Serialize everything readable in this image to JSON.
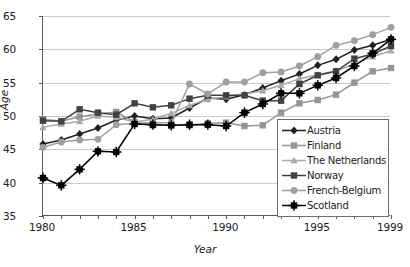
{
  "chart_data": {
    "type": "line",
    "title": "",
    "xlabel": "Year",
    "ylabel": "Age",
    "xlim": [
      1980,
      1999
    ],
    "ylim": [
      35,
      65
    ],
    "yticks": [
      35,
      40,
      45,
      50,
      55,
      60,
      65
    ],
    "xticks": [
      1980,
      1981,
      1982,
      1983,
      1984,
      1985,
      1986,
      1987,
      1988,
      1989,
      1990,
      1991,
      1992,
      1993,
      1994,
      1995,
      1996,
      1997,
      1998,
      1999
    ],
    "xtick_labels": [
      "1980",
      "1985",
      "1990",
      "1995",
      "1999"
    ],
    "xtick_label_years": [
      1980,
      1985,
      1990,
      1995,
      1999
    ],
    "grid": "horizontal",
    "legend_position": "bottom-right",
    "x": [
      1980,
      1981,
      1982,
      1983,
      1984,
      1985,
      1986,
      1987,
      1988,
      1989,
      1990,
      1991,
      1992,
      1993,
      1994,
      1995,
      1996,
      1997,
      1998,
      1999
    ],
    "series": [
      {
        "name": "Austria",
        "color": "#231f20",
        "marker": "diamond",
        "values": [
          45.8,
          46.4,
          47.3,
          48.2,
          49.4,
          50.0,
          49.6,
          49.7,
          51.2,
          52.7,
          52.5,
          53.2,
          54.2,
          55.3,
          56.3,
          57.6,
          58.5,
          59.9,
          60.6,
          61.5
        ]
      },
      {
        "name": "Finland",
        "color": "#939598",
        "marker": "square",
        "values": [
          49.5,
          49.2,
          49.9,
          50.3,
          50.6,
          49.1,
          48.6,
          48.6,
          48.6,
          48.9,
          49.0,
          48.5,
          48.6,
          50.5,
          51.9,
          52.4,
          53.2,
          55.0,
          56.7,
          57.2
        ]
      },
      {
        "name": "The Netherlands",
        "color": "#a7a9ac",
        "marker": "triangle",
        "values": [
          48.3,
          48.8,
          49.2,
          50.0,
          49.8,
          49.1,
          49.5,
          50.4,
          51.6,
          52.5,
          52.9,
          53.3,
          53.8,
          54.6,
          55.6,
          56.2,
          56.8,
          57.8,
          58.9,
          59.8
        ]
      },
      {
        "name": "Norway",
        "color": "#414042",
        "marker": "square",
        "values": [
          49.3,
          49.2,
          51.0,
          50.5,
          50.2,
          51.9,
          51.3,
          51.6,
          52.6,
          53.1,
          53.1,
          53.1,
          52.3,
          52.3,
          54.8,
          56.1,
          56.7,
          58.6,
          59.3,
          60.5
        ]
      },
      {
        "name": "French-Belgium",
        "color": "#9d9fa2",
        "marker": "circle",
        "values": [
          45.3,
          46.1,
          46.4,
          46.5,
          48.7,
          48.9,
          49.0,
          49.0,
          54.8,
          53.3,
          55.1,
          55.1,
          56.5,
          56.6,
          57.5,
          58.9,
          60.6,
          61.3,
          62.2,
          63.3
        ]
      },
      {
        "name": "Scotland",
        "color": "#000000",
        "marker": "square-cross",
        "values": [
          40.7,
          39.6,
          42.0,
          44.7,
          44.6,
          48.8,
          48.7,
          48.6,
          48.7,
          48.7,
          48.5,
          50.5,
          51.8,
          53.4,
          53.4,
          54.6,
          55.7,
          57.5,
          59.4,
          61.5
        ]
      }
    ]
  },
  "legend": {
    "items": [
      {
        "label": "Austria"
      },
      {
        "label": "Finland"
      },
      {
        "label": "The Netherlands"
      },
      {
        "label": "Norway"
      },
      {
        "label": "French-Belgium"
      },
      {
        "label": "Scotland"
      }
    ]
  }
}
